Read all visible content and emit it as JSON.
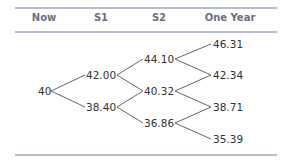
{
  "header": {
    "columns": [
      "Now",
      "S1",
      "S2",
      "One Year"
    ]
  },
  "tree": {
    "now": "40",
    "s1": [
      "42.00",
      "38.40"
    ],
    "s2": [
      "44.10",
      "40.32",
      "36.86"
    ],
    "one_year": [
      "46.31",
      "42.34",
      "38.71",
      "35.39"
    ]
  },
  "colors": {
    "rule": "#b9bdd0",
    "header_text": "#6c707c",
    "node_text": "#333333",
    "branch": "#555555"
  }
}
